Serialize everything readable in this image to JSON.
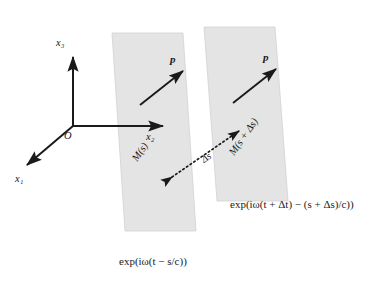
{
  "figure": {
    "background_color": "#ffffff",
    "ink_color": "#1a1a1a",
    "plane_fill": "#e3e3e3",
    "plane_stroke": "#cfcfcf"
  },
  "axes": {
    "origin_label": "O",
    "x1_label": "x₁",
    "x2_label": "x₂",
    "x3_label": "x₃"
  },
  "vectors": {
    "p_first": "p",
    "p_second": "p"
  },
  "planes": [
    {
      "name": "plane-m-s",
      "label": "M(s)",
      "phase_label": "exp(iω(t − s/c))"
    },
    {
      "name": "plane-m-s-plus-ds",
      "label": "M(s + Δs)",
      "phase_label": "exp(iω(t + Δt) − (s + Δs)/c))"
    }
  ],
  "separation": {
    "label": "Δs"
  }
}
